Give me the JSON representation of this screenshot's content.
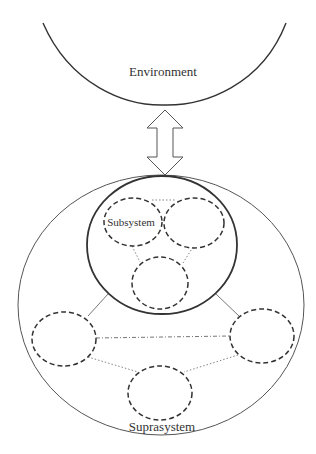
{
  "diagram": {
    "type": "system-hierarchy",
    "labels": {
      "environment": "Environment",
      "subsystem": "Subsystem",
      "suprasystem": "Suprasystem"
    },
    "colors": {
      "stroke": "#333333",
      "stroke_light": "#555555",
      "background": "#ffffff"
    },
    "nodes": [
      {
        "id": "environment",
        "shape": "arc",
        "label": "Environment"
      },
      {
        "id": "suprasystem",
        "shape": "ellipse",
        "style": "solid",
        "label": "Suprasystem"
      },
      {
        "id": "system",
        "shape": "ellipse",
        "style": "bold"
      },
      {
        "id": "subsystem-1",
        "shape": "ellipse",
        "style": "dashed",
        "label": "Subsystem"
      },
      {
        "id": "subsystem-2",
        "shape": "ellipse",
        "style": "dashed"
      },
      {
        "id": "subsystem-3",
        "shape": "ellipse",
        "style": "dashed"
      },
      {
        "id": "peer-system-left",
        "shape": "ellipse",
        "style": "dashed"
      },
      {
        "id": "peer-system-right",
        "shape": "ellipse",
        "style": "dashed"
      },
      {
        "id": "peer-system-bottom",
        "shape": "ellipse",
        "style": "dashed"
      }
    ],
    "edges": [
      {
        "from": "environment",
        "to": "suprasystem",
        "style": "double-arrow"
      },
      {
        "from": "subsystem-1",
        "to": "subsystem-2",
        "style": "dotted"
      },
      {
        "from": "subsystem-1",
        "to": "subsystem-3",
        "style": "dotted"
      },
      {
        "from": "subsystem-2",
        "to": "subsystem-3",
        "style": "dotted"
      },
      {
        "from": "system",
        "to": "peer-system-left",
        "style": "solid"
      },
      {
        "from": "system",
        "to": "peer-system-right",
        "style": "solid"
      },
      {
        "from": "peer-system-left",
        "to": "peer-system-right",
        "style": "dash-dot"
      },
      {
        "from": "peer-system-left",
        "to": "peer-system-bottom",
        "style": "dotted"
      },
      {
        "from": "peer-system-right",
        "to": "peer-system-bottom",
        "style": "dotted"
      }
    ]
  }
}
